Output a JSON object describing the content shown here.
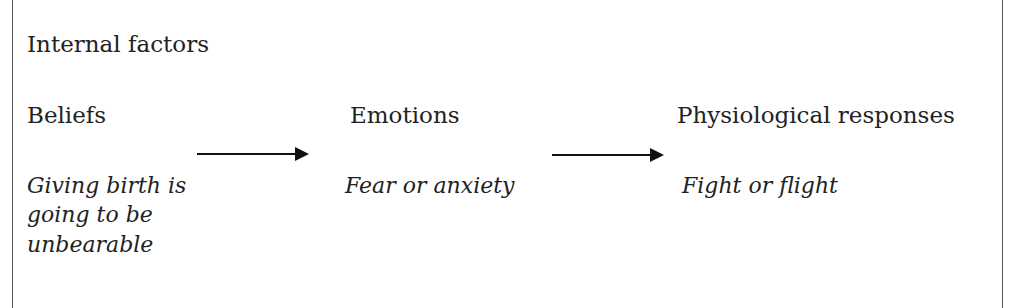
{
  "diagram": {
    "title": "Internal factors",
    "nodes": [
      {
        "heading": "Beliefs",
        "example_lines": [
          "Giving birth is",
          "going to be",
          "unbearable"
        ]
      },
      {
        "heading": "Emotions",
        "example_lines": [
          "Fear or anxiety"
        ]
      },
      {
        "heading": "Physiological responses",
        "example_lines": [
          "Fight or flight"
        ]
      }
    ],
    "edges": [
      {
        "from": "Beliefs",
        "to": "Emotions"
      },
      {
        "from": "Emotions",
        "to": "Physiological responses"
      }
    ]
  }
}
